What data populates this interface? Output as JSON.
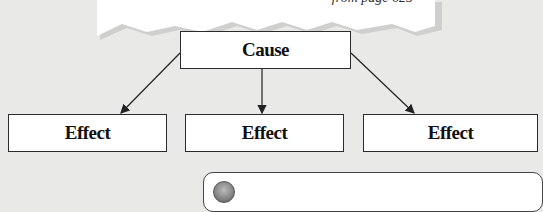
{
  "callout": {
    "source": "—from page 625"
  },
  "diagram": {
    "type": "cause-effect",
    "cause": {
      "label": "Cause"
    },
    "effects": [
      {
        "label": "Effect"
      },
      {
        "label": "Effect"
      },
      {
        "label": "Effect"
      }
    ]
  },
  "note": {
    "icon": "circle-bullet-icon"
  },
  "colors": {
    "background": "#e9e9e7",
    "box_fill": "#ffffff",
    "box_border": "#2b2b2b",
    "callout_shadow": "#c8c8c6"
  }
}
